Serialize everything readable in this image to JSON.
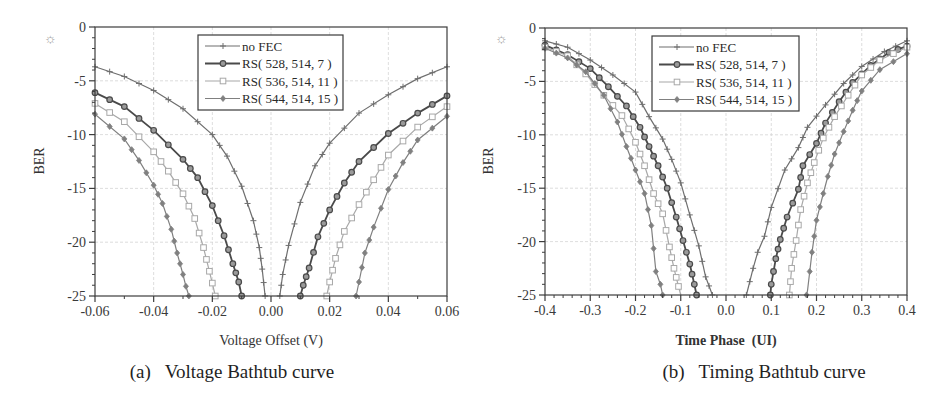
{
  "figure": {
    "panels": [
      {
        "caption": "(a)   Voltage Bathtub curve",
        "ylabel": "BER",
        "xlabel": "Voltage Offset (V)"
      },
      {
        "caption": "(b)   Timing Bathtub curve",
        "ylabel": "BER",
        "xlabel": "Time Phase  (UI)"
      }
    ],
    "icon": "sun-icon"
  },
  "chart_data": [
    {
      "type": "line",
      "title": "(a) Voltage Bathtub curve",
      "xlabel": "Voltage Offset (V)",
      "ylabel": "BER",
      "xlim": [
        -0.06,
        0.06
      ],
      "ylim": [
        -25,
        0
      ],
      "xticks": [
        -0.06,
        -0.04,
        -0.02,
        0.0,
        0.02,
        0.04,
        0.06
      ],
      "xtick_labels": [
        "-0.06",
        "-0.04",
        "-0.02",
        "0.00",
        "0.02",
        "0.04",
        "0.06"
      ],
      "yticks": [
        0,
        -5,
        -10,
        -15,
        -20,
        -25
      ],
      "ytick_labels": [
        "0",
        "-5",
        "-10",
        "-15",
        "-20",
        "-25"
      ],
      "grid": true,
      "legend_position": "upper center",
      "series": [
        {
          "name": "no FEC",
          "color": "#6e6e6e",
          "marker": "plus",
          "width": 1.2,
          "left": [
            [
              -0.06,
              -3.7
            ],
            [
              -0.05,
              -4.6
            ],
            [
              -0.04,
              -5.9
            ],
            [
              -0.03,
              -7.6
            ],
            [
              -0.02,
              -10.0
            ],
            [
              -0.015,
              -12.0
            ],
            [
              -0.01,
              -14.8
            ],
            [
              -0.006,
              -18.0
            ],
            [
              -0.004,
              -20.5
            ],
            [
              -0.003,
              -22.5
            ],
            [
              -0.002,
              -25.0
            ]
          ],
          "right": [
            [
              0.003,
              -25.0
            ],
            [
              0.004,
              -23.0
            ],
            [
              0.006,
              -20.3
            ],
            [
              0.01,
              -16.3
            ],
            [
              0.015,
              -12.9
            ],
            [
              0.02,
              -10.8
            ],
            [
              0.03,
              -8.0
            ],
            [
              0.04,
              -6.3
            ],
            [
              0.05,
              -4.8
            ],
            [
              0.06,
              -3.7
            ]
          ]
        },
        {
          "name": "RS( 528, 514, 7 )",
          "color": "#4a4a4a",
          "marker": "circle",
          "width": 1.8,
          "left": [
            [
              -0.06,
              -6.1
            ],
            [
              -0.05,
              -7.4
            ],
            [
              -0.04,
              -9.6
            ],
            [
              -0.03,
              -12.3
            ],
            [
              -0.025,
              -14.0
            ],
            [
              -0.02,
              -16.6
            ],
            [
              -0.016,
              -19.4
            ],
            [
              -0.013,
              -22.0
            ],
            [
              -0.011,
              -23.7
            ],
            [
              -0.01,
              -25.0
            ]
          ],
          "right": [
            [
              0.01,
              -25.0
            ],
            [
              0.011,
              -24.0
            ],
            [
              0.013,
              -22.4
            ],
            [
              0.016,
              -19.5
            ],
            [
              0.02,
              -17.0
            ],
            [
              0.025,
              -14.5
            ],
            [
              0.03,
              -12.5
            ],
            [
              0.04,
              -9.9
            ],
            [
              0.05,
              -8.0
            ],
            [
              0.06,
              -6.4
            ]
          ]
        },
        {
          "name": "RS( 536, 514, 11 )",
          "color": "#a8a8a8",
          "marker": "square",
          "width": 1.2,
          "left": [
            [
              -0.06,
              -7.1
            ],
            [
              -0.05,
              -8.8
            ],
            [
              -0.04,
              -11.6
            ],
            [
              -0.035,
              -13.4
            ],
            [
              -0.03,
              -15.5
            ],
            [
              -0.026,
              -17.8
            ],
            [
              -0.023,
              -20.5
            ],
            [
              -0.021,
              -22.7
            ],
            [
              -0.02,
              -23.8
            ],
            [
              -0.019,
              -25.0
            ]
          ],
          "right": [
            [
              0.019,
              -25.0
            ],
            [
              0.02,
              -23.7
            ],
            [
              0.022,
              -21.5
            ],
            [
              0.025,
              -19.0
            ],
            [
              0.03,
              -16.5
            ],
            [
              0.035,
              -14.2
            ],
            [
              0.04,
              -11.9
            ],
            [
              0.05,
              -9.3
            ],
            [
              0.06,
              -7.4
            ]
          ]
        },
        {
          "name": "RS( 544, 514, 15 )",
          "color": "#808080",
          "marker": "diamond",
          "width": 1.2,
          "left": [
            [
              -0.06,
              -8.1
            ],
            [
              -0.05,
              -10.4
            ],
            [
              -0.045,
              -12.4
            ],
            [
              -0.04,
              -14.7
            ],
            [
              -0.037,
              -16.4
            ],
            [
              -0.034,
              -18.8
            ],
            [
              -0.032,
              -21.0
            ],
            [
              -0.03,
              -23.0
            ],
            [
              -0.029,
              -24.1
            ],
            [
              -0.028,
              -25.0
            ]
          ],
          "right": [
            [
              0.029,
              -25.0
            ],
            [
              0.03,
              -23.7
            ],
            [
              0.032,
              -21.0
            ],
            [
              0.035,
              -18.6
            ],
            [
              0.04,
              -15.1
            ],
            [
              0.045,
              -12.6
            ],
            [
              0.05,
              -10.5
            ],
            [
              0.06,
              -8.3
            ]
          ]
        }
      ]
    },
    {
      "type": "line",
      "title": "(b) Timing Bathtub curve",
      "xlabel": "Time Phase  (UI)",
      "ylabel": "BER",
      "xlim": [
        -0.4,
        0.4
      ],
      "ylim": [
        -25,
        0
      ],
      "xticks": [
        -0.4,
        -0.3,
        -0.2,
        -0.1,
        0.0,
        0.1,
        0.2,
        0.3,
        0.4
      ],
      "xtick_labels": [
        "-0.4",
        "-0.3",
        "-0.2",
        "-0.1",
        "0.0",
        "0.1",
        "0.2",
        "0.3",
        "0.4"
      ],
      "yticks": [
        0,
        -5,
        -10,
        -15,
        -20,
        -25
      ],
      "ytick_labels": [
        "0",
        "-5",
        "-10",
        "-15",
        "-20",
        "-25"
      ],
      "grid": true,
      "legend_position": "upper center",
      "series": [
        {
          "name": "no FEC",
          "color": "#6e6e6e",
          "marker": "plus",
          "width": 1.2,
          "left": [
            [
              -0.4,
              -1.2
            ],
            [
              -0.35,
              -1.8
            ],
            [
              -0.3,
              -3.0
            ],
            [
              -0.25,
              -4.4
            ],
            [
              -0.2,
              -6.0
            ],
            [
              -0.17,
              -8.3
            ],
            [
              -0.14,
              -10.4
            ],
            [
              -0.12,
              -12.3
            ],
            [
              -0.1,
              -14.5
            ],
            [
              -0.08,
              -17.5
            ],
            [
              -0.06,
              -20.4
            ],
            [
              -0.045,
              -23.3
            ],
            [
              -0.03,
              -25.0
            ]
          ],
          "right": [
            [
              0.045,
              -25.0
            ],
            [
              0.06,
              -22.5
            ],
            [
              0.07,
              -21.0
            ],
            [
              0.085,
              -19.5
            ],
            [
              0.1,
              -16.8
            ],
            [
              0.13,
              -13.3
            ],
            [
              0.16,
              -11.2
            ],
            [
              0.18,
              -9.3
            ],
            [
              0.22,
              -7.2
            ],
            [
              0.26,
              -5.2
            ],
            [
              0.3,
              -3.6
            ],
            [
              0.35,
              -2.2
            ],
            [
              0.4,
              -1.2
            ]
          ]
        },
        {
          "name": "RS( 528, 514, 7 )",
          "color": "#4a4a4a",
          "marker": "circle",
          "width": 1.8,
          "left": [
            [
              -0.4,
              -1.6
            ],
            [
              -0.35,
              -2.5
            ],
            [
              -0.3,
              -3.8
            ],
            [
              -0.26,
              -5.5
            ],
            [
              -0.22,
              -7.3
            ],
            [
              -0.19,
              -9.3
            ],
            [
              -0.17,
              -11.1
            ],
            [
              -0.15,
              -12.9
            ],
            [
              -0.13,
              -15.0
            ],
            [
              -0.11,
              -17.7
            ],
            [
              -0.095,
              -19.9
            ],
            [
              -0.08,
              -22.1
            ],
            [
              -0.07,
              -24.0
            ],
            [
              -0.065,
              -25.0
            ]
          ],
          "right": [
            [
              0.098,
              -25.0
            ],
            [
              0.1,
              -24.0
            ],
            [
              0.11,
              -21.6
            ],
            [
              0.12,
              -19.8
            ],
            [
              0.135,
              -17.7
            ],
            [
              0.16,
              -15.1
            ],
            [
              0.17,
              -12.9
            ],
            [
              0.2,
              -10.8
            ],
            [
              0.22,
              -8.9
            ],
            [
              0.25,
              -6.9
            ],
            [
              0.28,
              -5.1
            ],
            [
              0.32,
              -3.5
            ],
            [
              0.36,
              -2.3
            ],
            [
              0.4,
              -1.7
            ]
          ]
        },
        {
          "name": "RS( 536, 514, 11 )",
          "color": "#a8a8a8",
          "marker": "square",
          "width": 1.2,
          "left": [
            [
              -0.4,
              -1.8
            ],
            [
              -0.35,
              -2.6
            ],
            [
              -0.31,
              -4.3
            ],
            [
              -0.27,
              -6.3
            ],
            [
              -0.23,
              -8.2
            ],
            [
              -0.2,
              -10.7
            ],
            [
              -0.18,
              -12.9
            ],
            [
              -0.16,
              -15.5
            ],
            [
              -0.14,
              -17.4
            ],
            [
              -0.125,
              -20.5
            ],
            [
              -0.115,
              -22.5
            ],
            [
              -0.105,
              -24.2
            ],
            [
              -0.1,
              -25.0
            ]
          ],
          "right": [
            [
              0.14,
              -25.0
            ],
            [
              0.145,
              -22.5
            ],
            [
              0.155,
              -19.9
            ],
            [
              0.165,
              -17.0
            ],
            [
              0.18,
              -14.5
            ],
            [
              0.195,
              -12.6
            ],
            [
              0.215,
              -10.3
            ],
            [
              0.24,
              -8.3
            ],
            [
              0.27,
              -6.3
            ],
            [
              0.3,
              -4.4
            ],
            [
              0.34,
              -3.0
            ],
            [
              0.4,
              -1.8
            ]
          ]
        },
        {
          "name": "RS( 544, 514, 15 )",
          "color": "#808080",
          "marker": "diamond",
          "width": 1.2,
          "left": [
            [
              -0.4,
              -1.9
            ],
            [
              -0.35,
              -2.8
            ],
            [
              -0.31,
              -4.1
            ],
            [
              -0.27,
              -6.3
            ],
            [
              -0.24,
              -8.8
            ],
            [
              -0.22,
              -11.1
            ],
            [
              -0.2,
              -13.3
            ],
            [
              -0.18,
              -15.5
            ],
            [
              -0.165,
              -18.5
            ],
            [
              -0.155,
              -22.8
            ],
            [
              -0.145,
              -24.0
            ],
            [
              -0.14,
              -25.0
            ]
          ],
          "right": [
            [
              0.178,
              -25.0
            ],
            [
              0.18,
              -24.6
            ],
            [
              0.19,
              -21.0
            ],
            [
              0.2,
              -18.0
            ],
            [
              0.215,
              -15.5
            ],
            [
              0.225,
              -13.9
            ],
            [
              0.24,
              -11.8
            ],
            [
              0.26,
              -9.7
            ],
            [
              0.28,
              -7.7
            ],
            [
              0.3,
              -5.9
            ],
            [
              0.34,
              -3.9
            ],
            [
              0.4,
              -2.4
            ]
          ]
        }
      ]
    }
  ]
}
